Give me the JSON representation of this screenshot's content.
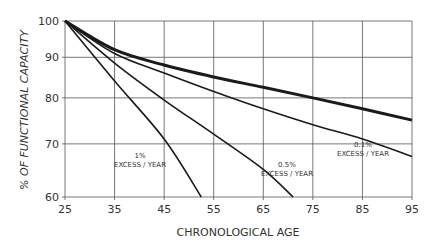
{
  "chart_data": {
    "type": "line",
    "title": "",
    "xlabel": "CHRONOLOGICAL AGE",
    "ylabel": "% OF FUNCTIONAL CAPACITY",
    "xlim": [
      25,
      95
    ],
    "ylim": [
      60,
      100
    ],
    "yscale": "log",
    "grid": true,
    "x_ticks": [
      25,
      35,
      45,
      55,
      65,
      75,
      85,
      95
    ],
    "y_ticks": [
      60,
      70,
      80,
      90,
      100
    ],
    "series": [
      {
        "name": "Normal aging",
        "stroke_width": 3,
        "x": [
          25,
          35,
          45,
          55,
          65,
          75,
          85,
          95
        ],
        "values": [
          100,
          92,
          88,
          85,
          82.5,
          80,
          77.5,
          75
        ]
      },
      {
        "name": "0.1% EXCESS/YEAR",
        "stroke_width": 1.6,
        "x": [
          25,
          35,
          45,
          55,
          65,
          75,
          85,
          95
        ],
        "values": [
          100,
          91,
          86,
          81.5,
          77.5,
          74,
          71,
          67.5
        ]
      },
      {
        "name": "0.5% EXCESS/YEAR",
        "stroke_width": 1.6,
        "x": [
          25,
          35,
          45,
          55,
          65,
          71
        ],
        "values": [
          100,
          88.5,
          79.5,
          72,
          65,
          60
        ]
      },
      {
        "name": "1% EXCESS/YEAR",
        "stroke_width": 1.6,
        "x": [
          25,
          35,
          45,
          52.5
        ],
        "values": [
          100,
          84,
          71,
          60
        ]
      }
    ],
    "annotations": [
      {
        "line1": "1%",
        "line2": "EXCESS / YEAR",
        "x": 140,
        "y": 158
      },
      {
        "line1": "0.5%",
        "line2": "EXCESS / YEAR",
        "x": 287,
        "y": 167
      },
      {
        "line1": "0.1%",
        "line2": "EXCESS / YEAR",
        "x": 363,
        "y": 147
      }
    ]
  }
}
